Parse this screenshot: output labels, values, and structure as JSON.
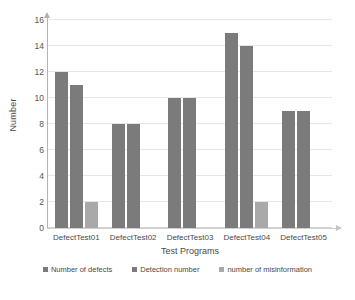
{
  "chart_data": {
    "type": "bar",
    "title": "",
    "subtitle": "",
    "xlabel": "Test Programs",
    "ylabel": "Number",
    "categories": [
      "DefectTest01",
      "DefectTest02",
      "DefectTest03",
      "DefectTest04",
      "DefectTest05"
    ],
    "series": [
      {
        "name": "Number of defects",
        "color": "#7b7b7b",
        "values": [
          12,
          8,
          10,
          15,
          9
        ]
      },
      {
        "name": "Detection number",
        "color": "#7b7b7b",
        "values": [
          11,
          8,
          10,
          14,
          9
        ]
      },
      {
        "name": "number of misinformation",
        "color": "#a9a9a9",
        "values": [
          2,
          0,
          0,
          2,
          0
        ]
      }
    ],
    "ylim": [
      0,
      16
    ],
    "yticks": [
      0,
      2,
      4,
      6,
      8,
      10,
      12,
      14,
      16
    ],
    "ytick_labels": [
      "0",
      "2",
      "4",
      "6",
      "8",
      "10",
      "12",
      "14",
      "16"
    ],
    "grid": "horizontal",
    "legend_position": "bottom"
  }
}
